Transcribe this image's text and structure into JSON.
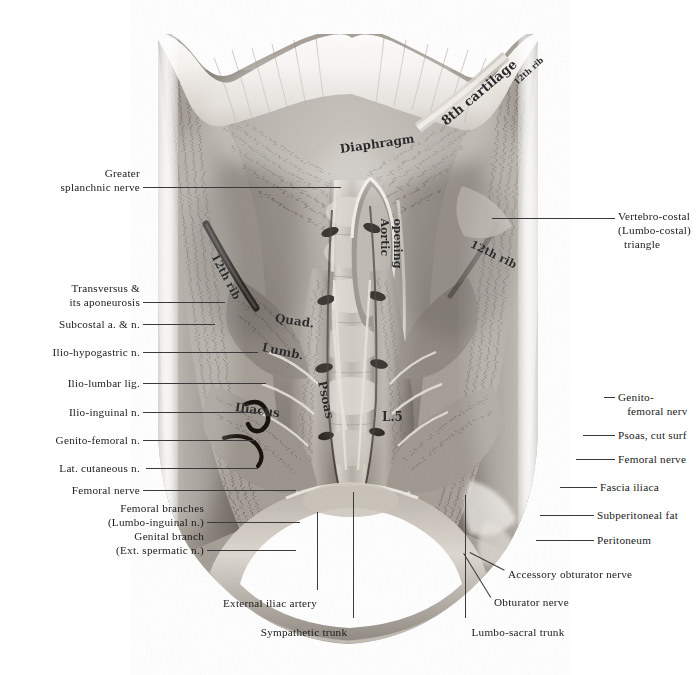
{
  "figure": {
    "kind": "anatomical-photograph",
    "palette": {
      "background": "#ffffff",
      "ink": "#1a1a1a",
      "leader": "#3a3a3a",
      "tissue_light": "#e9e6e1",
      "tissue_mid": "#9a948c",
      "tissue_dark": "#5d574f",
      "shadow": "#221f1b",
      "fat_highlight": "#f4f1ec"
    }
  },
  "labels_left": [
    {
      "id": "greater-splanchnic-nerve",
      "lines": [
        "Greater",
        "   splanchnic nerve"
      ],
      "text_right_x": 140,
      "text_top_y": 166,
      "leader": {
        "x1": 143,
        "y1": 187,
        "x2": 341,
        "y2": 187
      }
    },
    {
      "id": "transversus-and-aponeurosis",
      "lines": [
        "Transversus &",
        "   its aponeurosis"
      ],
      "text_right_x": 140,
      "text_top_y": 281,
      "leader": {
        "x1": 143,
        "y1": 302,
        "x2": 225,
        "y2": 302
      }
    },
    {
      "id": "subcostal-artery-and-nerve",
      "lines": [
        "Subcostal a. & n."
      ],
      "text_right_x": 140,
      "text_top_y": 317,
      "leader": {
        "x1": 143,
        "y1": 324,
        "x2": 215,
        "y2": 324
      }
    },
    {
      "id": "ilio-hypogastric-nerve",
      "lines": [
        "Ilio-hypogastric n."
      ],
      "text_right_x": 140,
      "text_top_y": 345,
      "leader": {
        "x1": 143,
        "y1": 352,
        "x2": 258,
        "y2": 352
      }
    },
    {
      "id": "ilio-lumbar-ligament",
      "lines": [
        "Ilio-lumbar lig."
      ],
      "text_right_x": 140,
      "text_top_y": 376,
      "leader": {
        "x1": 143,
        "y1": 383,
        "x2": 266,
        "y2": 383
      }
    },
    {
      "id": "ilio-inguinal-nerve",
      "lines": [
        "Ilio-inguinal n."
      ],
      "text_right_x": 140,
      "text_top_y": 405,
      "leader": {
        "x1": 143,
        "y1": 412,
        "x2": 262,
        "y2": 412
      }
    },
    {
      "id": "genito-femoral-nerve-left",
      "lines": [
        "Genito-femoral n."
      ],
      "text_right_x": 140,
      "text_top_y": 433,
      "leader": {
        "x1": 143,
        "y1": 440,
        "x2": 256,
        "y2": 440
      }
    },
    {
      "id": "lateral-cutaneous-nerve",
      "lines": [
        "Lat. cutaneous n."
      ],
      "text_right_x": 140,
      "text_top_y": 461,
      "leader": {
        "x1": 146,
        "y1": 468,
        "x2": 258,
        "y2": 468
      }
    },
    {
      "id": "femoral-nerve-left",
      "lines": [
        "Femoral nerve"
      ],
      "text_right_x": 140,
      "text_top_y": 483,
      "leader": {
        "x1": 143,
        "y1": 490,
        "x2": 296,
        "y2": 490
      }
    },
    {
      "id": "femoral-branches-lumbo-inguinal",
      "lines": [
        "Femoral branches",
        "   (Lumbo-inguinal n.)"
      ],
      "text_right_x": 204,
      "text_top_y": 501,
      "leader": {
        "x1": 207,
        "y1": 522,
        "x2": 300,
        "y2": 522
      }
    },
    {
      "id": "genital-branch-ext-spermatic",
      "lines": [
        "Genital branch",
        "   (Ext. spermatic n.)"
      ],
      "text_right_x": 204,
      "text_top_y": 529,
      "leader": {
        "x1": 207,
        "y1": 550,
        "x2": 296,
        "y2": 550
      }
    }
  ],
  "labels_right": [
    {
      "id": "vertebro-costal-triangle",
      "lines": [
        "Vertebro-costal",
        "(Lumbo-costal)",
        "  triangle"
      ],
      "text_left_x": 618,
      "text_top_y": 209,
      "leader": {
        "x1": 492,
        "y1": 218,
        "x2": 615,
        "y2": 218
      }
    },
    {
      "id": "genito-femoral-nerve-right",
      "lines": [
        "Genito-",
        "   femoral nerv"
      ],
      "text_left_x": 618,
      "text_top_y": 390,
      "leader": {
        "x1": 604,
        "y1": 397,
        "x2": 615,
        "y2": 397
      }
    },
    {
      "id": "psoas-cut-surface",
      "lines": [
        "Psoas, cut surf"
      ],
      "text_left_x": 618,
      "text_top_y": 428,
      "leader": {
        "x1": 583,
        "y1": 435,
        "x2": 615,
        "y2": 435
      }
    },
    {
      "id": "femoral-nerve-right",
      "lines": [
        "Femoral nerve"
      ],
      "text_left_x": 618,
      "text_top_y": 452,
      "leader": {
        "x1": 576,
        "y1": 459,
        "x2": 615,
        "y2": 459
      }
    },
    {
      "id": "fascia-iliaca",
      "lines": [
        "Fascia iliaca"
      ],
      "text_left_x": 600,
      "text_top_y": 480,
      "leader": {
        "x1": 560,
        "y1": 487,
        "x2": 597,
        "y2": 487
      }
    },
    {
      "id": "subperitoneal-fat",
      "lines": [
        "Subperitoneal fat"
      ],
      "text_left_x": 597,
      "text_top_y": 508,
      "leader": {
        "x1": 540,
        "y1": 515,
        "x2": 594,
        "y2": 515
      }
    },
    {
      "id": "peritoneum",
      "lines": [
        "Peritoneum"
      ],
      "text_left_x": 597,
      "text_top_y": 533,
      "leader": {
        "x1": 536,
        "y1": 540,
        "x2": 594,
        "y2": 540
      }
    },
    {
      "id": "accessory-obturator-nerve",
      "lines": [
        "Accessory obturator nerve"
      ],
      "text_left_x": 508,
      "text_top_y": 567,
      "leader": {
        "x1": 470,
        "y1": 552,
        "x2": 505,
        "y2": 570
      }
    },
    {
      "id": "obturator-nerve",
      "lines": [
        "Obturator nerve"
      ],
      "text_left_x": 494,
      "text_top_y": 595,
      "leader": {
        "x1": 464,
        "y1": 553,
        "x2": 491,
        "y2": 597
      }
    }
  ],
  "labels_bottom": [
    {
      "id": "external-iliac-artery",
      "lines": [
        "External iliac artery"
      ],
      "text_center_x": 270,
      "text_top_y": 596,
      "leader": {
        "x1": 318,
        "y1": 512,
        "x2": 318,
        "y2": 590
      }
    },
    {
      "id": "sympathetic-trunk",
      "lines": [
        "Sympathetic trunk"
      ],
      "text_center_x": 304,
      "text_top_y": 625,
      "leader": {
        "x1": 354,
        "y1": 492,
        "x2": 354,
        "y2": 618
      }
    },
    {
      "id": "lumbo-sacral-trunk",
      "lines": [
        "Lumbo-sacral trunk"
      ],
      "text_center_x": 518,
      "text_top_y": 625,
      "leader": {
        "x1": 466,
        "y1": 495,
        "x2": 466,
        "y2": 618
      }
    }
  ],
  "specimen_annotations": [
    {
      "id": "diaphragm",
      "text": "Diaphragm",
      "x": 340,
      "y": 142,
      "rotate": -8,
      "size": 12
    },
    {
      "id": "aortic-opening",
      "text": "Aortic",
      "x": 384,
      "y": 212,
      "rotate": 90,
      "size": 11
    },
    {
      "id": "aortic-opening-2",
      "text": "opening",
      "x": 397,
      "y": 212,
      "rotate": 90,
      "size": 11
    },
    {
      "id": "eighth-cartilage",
      "text": "8th cartilage",
      "x": 443,
      "y": 115,
      "rotate": -40,
      "size": 13
    },
    {
      "id": "twelfth-rib-top-right",
      "text": "12th rib",
      "x": 515,
      "y": 78,
      "rotate": -42,
      "size": 8
    },
    {
      "id": "twelfth-rib-left",
      "text": "12th rib",
      "x": 214,
      "y": 248,
      "rotate": 62,
      "size": 11
    },
    {
      "id": "twelfth-rib-right",
      "text": "12th rib",
      "x": 471,
      "y": 237,
      "rotate": 26,
      "size": 11
    },
    {
      "id": "quadratus",
      "text": "Quad.",
      "x": 275,
      "y": 311,
      "rotate": 8,
      "size": 12
    },
    {
      "id": "lumborum",
      "text": "Lumb.",
      "x": 262,
      "y": 340,
      "rotate": 12,
      "size": 12
    },
    {
      "id": "psoas",
      "text": "Psoas",
      "x": 322,
      "y": 374,
      "rotate": 78,
      "size": 12
    },
    {
      "id": "iliacus",
      "text": "Iliacus",
      "x": 235,
      "y": 400,
      "rotate": 8,
      "size": 12
    },
    {
      "id": "l5-vertebra",
      "text": "L.5",
      "x": 382,
      "y": 410,
      "rotate": 0,
      "size": 12
    }
  ]
}
